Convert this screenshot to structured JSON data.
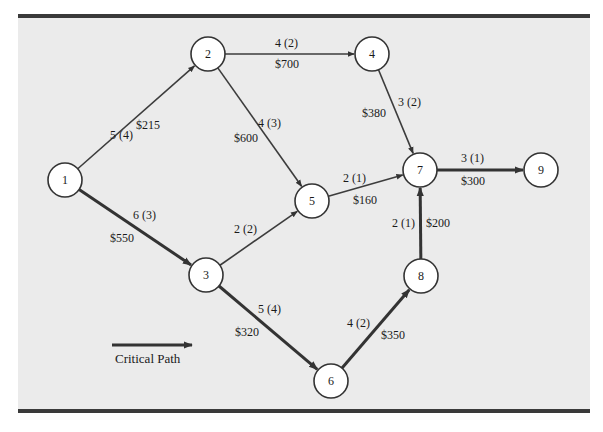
{
  "diagram": {
    "type": "project-network",
    "colors": {
      "background": "#ebebeb",
      "rule": "#3a3a3a",
      "edge": "#3c3c3c",
      "node_fill": "#ffffff",
      "node_stroke": "#333333"
    },
    "nodes": [
      {
        "id": "1",
        "label": "1",
        "x": 65,
        "y": 180
      },
      {
        "id": "2",
        "label": "2",
        "x": 208,
        "y": 54
      },
      {
        "id": "3",
        "label": "3",
        "x": 206,
        "y": 275
      },
      {
        "id": "4",
        "label": "4",
        "x": 372,
        "y": 54
      },
      {
        "id": "5",
        "label": "5",
        "x": 312,
        "y": 201
      },
      {
        "id": "6",
        "label": "6",
        "x": 331,
        "y": 381
      },
      {
        "id": "7",
        "label": "7",
        "x": 420,
        "y": 170
      },
      {
        "id": "8",
        "label": "8",
        "x": 421,
        "y": 276
      },
      {
        "id": "9",
        "label": "9",
        "x": 541,
        "y": 170
      }
    ],
    "edges": [
      {
        "from": "1",
        "to": "2",
        "time": "5 (4)",
        "cost": "$215",
        "critical": false
      },
      {
        "from": "1",
        "to": "3",
        "time": "6 (3)",
        "cost": "$550",
        "critical": true
      },
      {
        "from": "2",
        "to": "4",
        "time": "4 (2)",
        "cost": "$700",
        "critical": false
      },
      {
        "from": "2",
        "to": "5",
        "time": "4 (3)",
        "cost": "$600",
        "critical": false
      },
      {
        "from": "3",
        "to": "5",
        "time": "2 (2)",
        "cost": "",
        "critical": false
      },
      {
        "from": "3",
        "to": "6",
        "time": "5 (4)",
        "cost": "$320",
        "critical": true
      },
      {
        "from": "4",
        "to": "7",
        "time": "3 (2)",
        "cost": "$380",
        "critical": false
      },
      {
        "from": "5",
        "to": "7",
        "time": "2 (1)",
        "cost": "$160",
        "critical": false
      },
      {
        "from": "6",
        "to": "8",
        "time": "4 (2)",
        "cost": "$350",
        "critical": true
      },
      {
        "from": "8",
        "to": "7",
        "time": "2 (1)",
        "cost": "$200",
        "critical": true
      },
      {
        "from": "7",
        "to": "9",
        "time": "3 (1)",
        "cost": "$300",
        "critical": true
      }
    ],
    "legend": {
      "label": "Critical Path"
    }
  }
}
